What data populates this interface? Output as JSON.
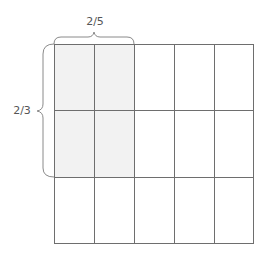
{
  "diagram": {
    "grid": {
      "columns": 5,
      "rows": 3,
      "shaded_columns": 2,
      "shaded_rows": 2
    },
    "labels": {
      "top": "2/5",
      "left": "2/3"
    },
    "braces": {
      "top": {
        "spans_columns": 2,
        "label": "2/5"
      },
      "left": {
        "spans_rows": 2,
        "label": "2/3"
      }
    },
    "colors": {
      "line": "#6e6e6e",
      "shade": "#f2f2f2",
      "brace": "#8a8a8a",
      "text": "#555555",
      "background": "#ffffff"
    }
  }
}
